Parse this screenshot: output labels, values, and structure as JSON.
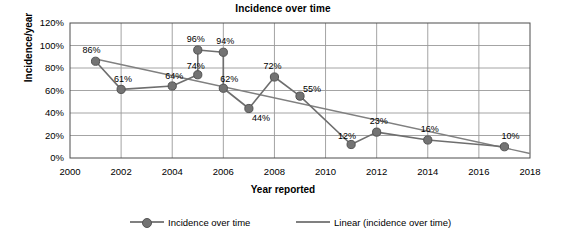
{
  "chart_data": {
    "type": "line",
    "title": "Incidence over time",
    "xlabel": "Year reported",
    "ylabel": "Incidence/year",
    "xlim": [
      2000,
      2018
    ],
    "ylim": [
      0,
      120
    ],
    "grid": true,
    "legend_position": "bottom",
    "xticks": [
      "2000",
      "2002",
      "2004",
      "2006",
      "2008",
      "2010",
      "2012",
      "2014",
      "2016",
      "2018"
    ],
    "xtick_values": [
      2000,
      2002,
      2004,
      2006,
      2008,
      2010,
      2012,
      2014,
      2016,
      2018
    ],
    "yticks": [
      "0%",
      "20%",
      "40%",
      "60%",
      "80%",
      "100%",
      "120%"
    ],
    "ytick_values": [
      0,
      20,
      40,
      60,
      80,
      100,
      120
    ],
    "series": [
      {
        "name": "Incidence over time",
        "type": "line-marker",
        "color": "#737373",
        "x": [
          2001,
          2002,
          2004,
          2005,
          2005,
          2006,
          2006,
          2007,
          2008,
          2009,
          2011,
          2012,
          2014,
          2017
        ],
        "values": [
          86,
          61,
          64,
          74,
          96,
          94,
          62,
          44,
          72,
          55,
          12,
          23,
          16,
          10
        ],
        "point_labels": [
          "86%",
          "61%",
          "64%",
          "74%",
          "96%",
          "94%",
          "62%",
          "44%",
          "72%",
          "55%",
          "12%",
          "23%",
          "16%",
          "10%"
        ]
      },
      {
        "name": "Linear (incidence over time)",
        "type": "trendline",
        "color": "#808080",
        "x": [
          2001,
          2018
        ],
        "values": [
          88,
          4
        ]
      }
    ]
  },
  "legend": {
    "items": [
      {
        "label": "Incidence over time",
        "marker": "line-with-circle"
      },
      {
        "label": "Linear (incidence over time)",
        "marker": "line"
      }
    ]
  }
}
